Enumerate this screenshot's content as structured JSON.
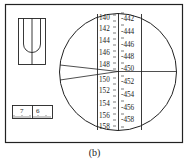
{
  "figure": {
    "caption": "(b)",
    "left_scale_labels": [
      "140",
      "142",
      "144",
      "146",
      "148",
      "150",
      "152",
      "154",
      "156",
      "158"
    ],
    "right_scale_labels": [
      "-442",
      "-444",
      "-446",
      "-448",
      "-450",
      "-452",
      "-454",
      "-456",
      "-458"
    ],
    "vernier": {
      "labels": [
        "7",
        "6"
      ]
    },
    "colors": {
      "line": "#222222",
      "background": "#ffffff"
    }
  }
}
